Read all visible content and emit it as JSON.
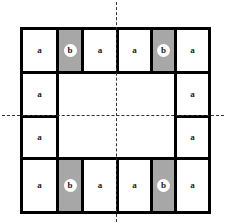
{
  "diagram": {
    "colors": {
      "border": "#000000",
      "b_fill": "#cfcfcf",
      "dash": "#333333"
    },
    "cells": [
      {
        "label": "a",
        "type": "a",
        "x": 20,
        "y": 27,
        "w": 39,
        "h": 47
      },
      {
        "label": "b",
        "type": "b",
        "x": 56,
        "y": 27,
        "w": 28,
        "h": 47
      },
      {
        "label": "a",
        "type": "a",
        "x": 81,
        "y": 27,
        "w": 38,
        "h": 47
      },
      {
        "label": "a",
        "type": "a",
        "x": 116,
        "y": 27,
        "w": 37,
        "h": 47
      },
      {
        "label": "b",
        "type": "b",
        "x": 150,
        "y": 27,
        "w": 27,
        "h": 47
      },
      {
        "label": "a",
        "type": "a",
        "x": 174,
        "y": 27,
        "w": 37,
        "h": 47
      },
      {
        "label": "a",
        "type": "a",
        "x": 20,
        "y": 71,
        "w": 39,
        "h": 47
      },
      {
        "label": "a",
        "type": "a",
        "x": 174,
        "y": 71,
        "w": 37,
        "h": 47
      },
      {
        "label": "a",
        "type": "a",
        "x": 20,
        "y": 115,
        "w": 39,
        "h": 45
      },
      {
        "label": "a",
        "type": "a",
        "x": 174,
        "y": 115,
        "w": 37,
        "h": 45
      },
      {
        "label": "a",
        "type": "a",
        "x": 20,
        "y": 157,
        "w": 39,
        "h": 57
      },
      {
        "label": "b",
        "type": "b",
        "x": 56,
        "y": 157,
        "w": 28,
        "h": 57
      },
      {
        "label": "a",
        "type": "a",
        "x": 81,
        "y": 157,
        "w": 38,
        "h": 57
      },
      {
        "label": "a",
        "type": "a",
        "x": 116,
        "y": 157,
        "w": 37,
        "h": 57
      },
      {
        "label": "b",
        "type": "b",
        "x": 150,
        "y": 157,
        "w": 27,
        "h": 57
      },
      {
        "label": "a",
        "type": "a",
        "x": 174,
        "y": 157,
        "w": 37,
        "h": 57
      }
    ],
    "inner_region": {
      "x": 56,
      "y": 71,
      "w": 121,
      "h": 89
    },
    "axes": {
      "vertical": {
        "x": 116,
        "y1": 2,
        "y2": 222
      },
      "horizontal": {
        "y": 115,
        "x1": 2,
        "x2": 224
      }
    }
  }
}
